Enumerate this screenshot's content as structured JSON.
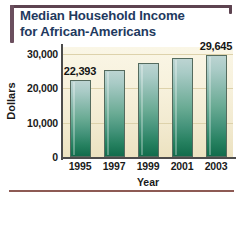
{
  "frame": {
    "accent_color": "#5d4350",
    "bottom_rule_color": "#8d5a54"
  },
  "title": {
    "line1": "Median Household Income",
    "line2": "for African-Americans",
    "color": "#1f3a5f"
  },
  "chart_data": {
    "type": "bar",
    "title": "Median Household Income for African-Americans",
    "categories": [
      "1995",
      "1997",
      "1999",
      "2001",
      "2003"
    ],
    "values": [
      22393,
      25200,
      27300,
      28900,
      29645
    ],
    "xlabel": "Year",
    "ylabel": "Dollars",
    "ylim": [
      0,
      32000
    ],
    "yticks": [
      0,
      10000,
      20000,
      30000
    ],
    "ytick_labels": [
      "0",
      "10,000",
      "20,000",
      "30,000"
    ],
    "grid": true,
    "legend": "none",
    "data_labels": [
      {
        "category": "1995",
        "text": "22,393"
      },
      {
        "category": "2003",
        "text": "29,645"
      }
    ],
    "bar_gradient": {
      "top": "#bcd4d2",
      "bottom": "#126c4c"
    },
    "plot_background": {
      "top": "#faf6e6",
      "bottom": "#ece2c0"
    },
    "axis_color": "#4c4c4c"
  }
}
